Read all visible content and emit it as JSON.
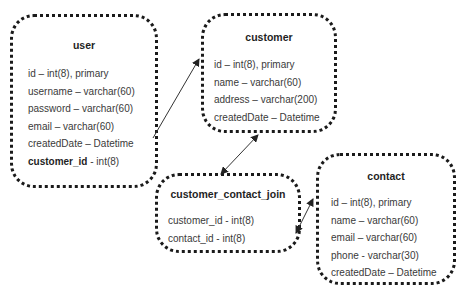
{
  "diagram": {
    "type": "entity-relationship",
    "entities": [
      {
        "id": "user",
        "title": "user",
        "fields": [
          {
            "text": "id – int(8), primary"
          },
          {
            "text": "username – varchar(60)"
          },
          {
            "text": "password – varchar(60)"
          },
          {
            "text": "email – varchar(60)"
          },
          {
            "text": "createdDate – Datetime"
          },
          {
            "name": "customer_id",
            "type": " - int(8)"
          }
        ]
      },
      {
        "id": "customer",
        "title": "customer",
        "fields": [
          {
            "text": "id – int(8), primary"
          },
          {
            "text": "name – varchar(60)"
          },
          {
            "text": "address – varchar(200)"
          },
          {
            "text": "createdDate – Datetime"
          }
        ]
      },
      {
        "id": "customer_contact_join",
        "title": "customer_contact_join",
        "fields": [
          {
            "text": "customer_id - int(8)"
          },
          {
            "text": "contact_id - int(8)"
          }
        ]
      },
      {
        "id": "contact",
        "title": "contact",
        "fields": [
          {
            "text": "id – int(8), primary"
          },
          {
            "text": "name – varchar(60)"
          },
          {
            "text": "email – varchar(60)"
          },
          {
            "text": "phone - varchar(30)"
          },
          {
            "text": "createdDate – Datetime"
          }
        ]
      }
    ],
    "relationships": [
      {
        "from": "user.customer_id",
        "to": "customer.id",
        "direction": "one-way"
      },
      {
        "from": "customer",
        "to": "customer_contact_join",
        "direction": "bidirectional"
      },
      {
        "from": "customer_contact_join.contact_id",
        "to": "contact.id",
        "direction": "bidirectional"
      }
    ],
    "colors": {
      "border": "#1a1a1a",
      "text": "#3a3a3a",
      "title": "#1f1f1f",
      "line": "#333333"
    }
  }
}
